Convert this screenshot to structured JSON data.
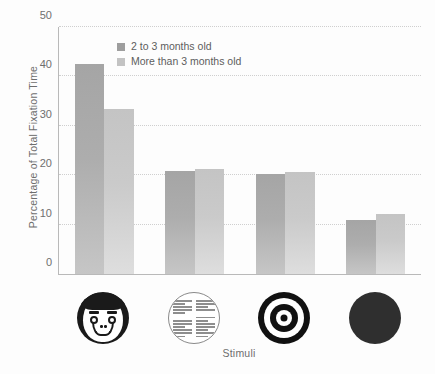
{
  "chart_data": {
    "type": "bar",
    "title": "",
    "subtitle": "",
    "xlabel": "Stimuli",
    "ylabel": "Percentage of Total Fixation Time",
    "categories": [
      "face",
      "newsprint",
      "bullseye",
      "solid-circle"
    ],
    "category_icons": [
      "face-icon",
      "newsprint-icon",
      "bullseye-icon",
      "solid-circle-icon"
    ],
    "series": [
      {
        "name": "2 to 3 months old",
        "color": "#a8a8a8",
        "values": [
          42.5,
          20.8,
          20.2,
          11.0
        ]
      },
      {
        "name": "More than 3 months old",
        "color": "#c8c8c8",
        "values": [
          33.5,
          21.3,
          20.6,
          12.2
        ]
      }
    ],
    "ylim": [
      0,
      50
    ],
    "yticks": [
      0,
      10,
      20,
      30,
      40,
      50
    ],
    "ytick_labels": [
      "0",
      "10",
      "20",
      "30",
      "40",
      "50"
    ],
    "grid": true,
    "grid_style": "dotted",
    "grid_color": "#cfcfcf",
    "legend_position": "top-left-inside",
    "axis_color": "#b9b9b9",
    "background": "#fdfdfd",
    "text_color": "#6d6d6d"
  },
  "legend": {
    "entries": [
      {
        "label": "2 to 3 months old"
      },
      {
        "label": "More than 3 months old"
      }
    ]
  },
  "axes": {
    "y_title": "Percentage of Total Fixation Time",
    "x_title": "Stimuli"
  }
}
